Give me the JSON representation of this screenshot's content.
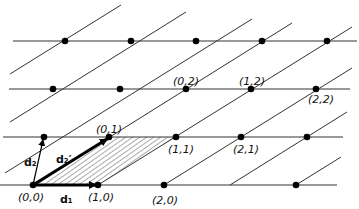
{
  "diagram": {
    "colors": {
      "line": "#333333",
      "point": "#000000",
      "hatch": "#555555",
      "background": "#ffffff"
    },
    "rows_y": [
      41,
      89,
      137,
      185
    ],
    "horizontal_lines": [
      {
        "x1": 13,
        "x2": 357,
        "y": 41
      },
      {
        "x1": 9,
        "x2": 350,
        "y": 89
      },
      {
        "x1": 3,
        "x2": 343,
        "y": 137
      },
      {
        "x1": 0,
        "x2": 337,
        "y": 185
      }
    ],
    "diagonal_lines": [
      {
        "x1": 10,
        "y1": 73,
        "x2": 121,
        "y2": 5
      },
      {
        "x1": 3,
        "y1": 124,
        "x2": 186,
        "y2": 11
      },
      {
        "x1": 3,
        "y1": 172,
        "x2": 251,
        "y2": 19
      },
      {
        "x1": 33,
        "y1": 185,
        "x2": 290,
        "y2": 27
      },
      {
        "x1": 98,
        "y1": 185,
        "x2": 350,
        "y2": 31
      },
      {
        "x1": 164,
        "y1": 185,
        "x2": 350,
        "y2": 70
      },
      {
        "x1": 230,
        "y1": 185,
        "x2": 346,
        "y2": 114
      },
      {
        "x1": 296,
        "y1": 185,
        "x2": 340,
        "y2": 158
      },
      {
        "x1": 3,
        "y1": 107,
        "x2": 66,
        "y2": 41
      },
      {
        "x1": 88,
        "y1": 209,
        "x2": 98,
        "y2": 203
      }
    ],
    "points": [
      {
        "x": 33,
        "y": 185,
        "label": "(0,0)"
      },
      {
        "x": 98,
        "y": 185,
        "label": "(1,0)"
      },
      {
        "x": 164,
        "y": 185,
        "label": "(2,0)"
      },
      {
        "x": 296,
        "y": 185,
        "label": ""
      },
      {
        "x": 44,
        "y": 137,
        "label": ""
      },
      {
        "x": 109,
        "y": 137,
        "label": "(0,1)"
      },
      {
        "x": 176,
        "y": 137,
        "label": "(1,1)"
      },
      {
        "x": 241,
        "y": 137,
        "label": "(2,1)"
      },
      {
        "x": 307,
        "y": 137,
        "label": ""
      },
      {
        "x": 53,
        "y": 89,
        "label": ""
      },
      {
        "x": 120,
        "y": 89,
        "label": ""
      },
      {
        "x": 186,
        "y": 89,
        "label": "(0,2)"
      },
      {
        "x": 251,
        "y": 89,
        "label": "(1,2)"
      },
      {
        "x": 316,
        "y": 89,
        "label": "(2,2)"
      },
      {
        "x": 65,
        "y": 41,
        "label": ""
      },
      {
        "x": 131,
        "y": 41,
        "label": ""
      },
      {
        "x": 196,
        "y": 41,
        "label": ""
      },
      {
        "x": 262,
        "y": 41,
        "label": ""
      },
      {
        "x": 327,
        "y": 41,
        "label": ""
      }
    ],
    "labels": {
      "p00": "(0,0)",
      "p10": "(1,0)",
      "p20": "(2,0)",
      "p01": "(0,1)",
      "p11": "(1,1)",
      "p21": "(2,1)",
      "p02": "(0,2)",
      "p12": "(1,2)",
      "p22": "(2,2)"
    },
    "vectors": {
      "d1": "d₁",
      "d2": "d₂",
      "d2_prime": "d₂′"
    },
    "hatched_cell": "parallelogram (0,0)-(1,0)-(1,1)-(0,1)"
  }
}
